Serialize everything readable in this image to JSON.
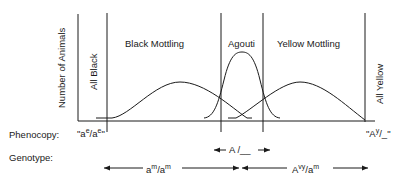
{
  "y_axis_label": "Number of Animals",
  "regions": {
    "all_black": "All Black",
    "black_mottling": "Black Mottling",
    "agouti": "Agouti",
    "yellow_mottling": "Yellow Mottling",
    "all_yellow": "All Yellow"
  },
  "row_labels": {
    "phenocopy": "Phenocopy:",
    "genotype": "Genotype:"
  },
  "phenocopy": {
    "left": {
      "q1": "\"a",
      "sup1": "e",
      "slash": "/a",
      "sup2": "e",
      "q2": "\""
    },
    "right": {
      "q1": "\"A",
      "sup1": "y",
      "rest": "/_\""
    }
  },
  "agouti_genotype": {
    "text": "A /__"
  },
  "genotypes": {
    "left": {
      "base1": "a",
      "sup1": "m",
      "slash": "/a",
      "sup2": "m"
    },
    "right": {
      "base1": "A",
      "sup1": "vy",
      "slash": "/a",
      "sup2": "m"
    }
  },
  "colors": {
    "ink": "#1a1a1a",
    "background": "#ffffff"
  }
}
